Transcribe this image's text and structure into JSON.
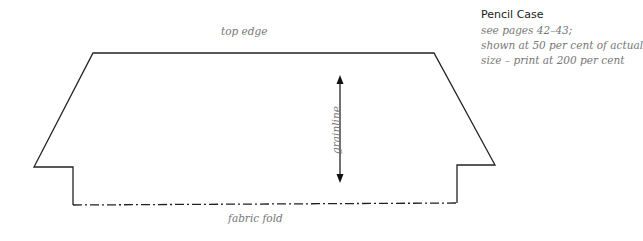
{
  "header": {
    "title": "Pencil Case",
    "notes": [
      "see pages 42–43;",
      "shown at 50 per cent of actual",
      "size – print at 200 per cent"
    ]
  },
  "pattern": {
    "top_label": "top edge",
    "fold_label": "fabric fold",
    "grainline_label": "grainline",
    "line_color": "#222222"
  }
}
